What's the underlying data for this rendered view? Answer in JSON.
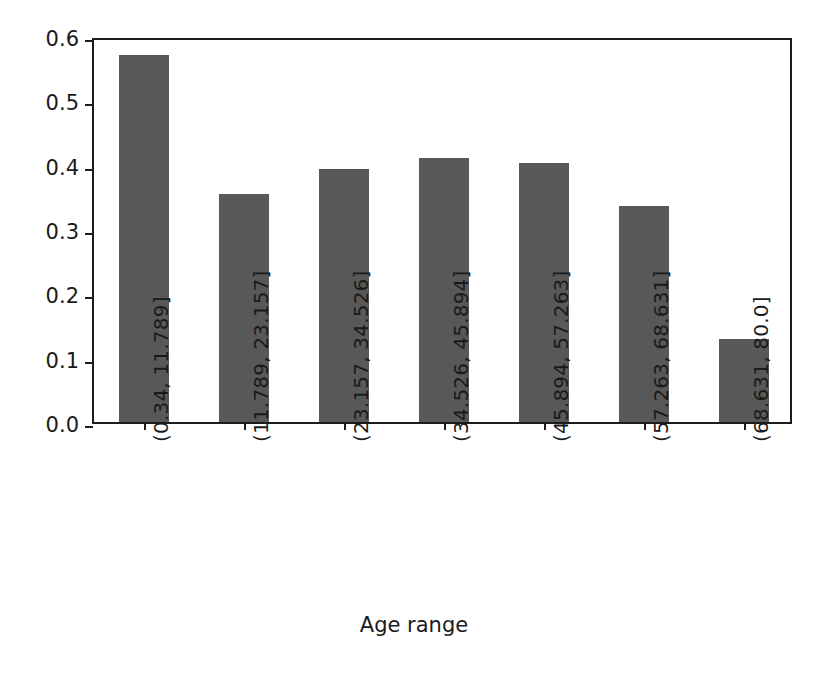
{
  "chart_data": {
    "type": "bar",
    "title": "",
    "xlabel": "Age range",
    "ylabel": "",
    "categories": [
      "(0.34, 11.789]",
      "(11.789, 23.157]",
      "(23.157, 34.526]",
      "(34.526, 45.894]",
      "(45.894, 57.263]",
      "(57.263, 68.631]",
      "(68.631, 80.0]"
    ],
    "values": [
      0.57,
      0.354,
      0.394,
      0.41,
      0.402,
      0.335,
      0.129
    ],
    "ylim": [
      0.0,
      0.6
    ],
    "xlim": [
      -0.5,
      6.5
    ],
    "yticks": [
      "0.0",
      "0.1",
      "0.2",
      "0.3",
      "0.4",
      "0.5",
      "0.6"
    ],
    "ytick_values": [
      0.0,
      0.1,
      0.2,
      0.3,
      0.4,
      0.5,
      0.6
    ],
    "grid": false,
    "legend": null,
    "bar_color": "#585858",
    "axis_color": "#1c1c1c",
    "background_color": "#ffffff",
    "bar_width_fraction": 0.5
  }
}
